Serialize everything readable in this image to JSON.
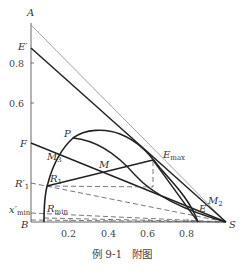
{
  "figure": {
    "caption": "例 9-1　附图",
    "type": "ternary-right-triangle phase diagram (extraction)"
  },
  "axes": {
    "x_ticks": [
      "0.2",
      "0.4",
      "0.6",
      "0.8"
    ],
    "y_ticks": [
      "0.6",
      "0.8"
    ]
  },
  "points": {
    "A": "A",
    "B": "B",
    "S": "S",
    "E_prime": "E′",
    "F": "F",
    "R1_prime": "R′",
    "R1_prime_sub": "1",
    "s_min": "x′",
    "s_min_sub": "min",
    "P": "P",
    "M": "M",
    "M2": "M",
    "M2_sub": "2",
    "M3": "M",
    "M3_sub": "3",
    "R1": "R",
    "R1_sub": "1",
    "Rmin": "R",
    "Rmin_sub": "min",
    "Emax": "E",
    "Emax_sub": "max",
    "E": "E"
  },
  "colors": {
    "line": "#222222",
    "thin": "#777777",
    "dash": "#555555"
  }
}
